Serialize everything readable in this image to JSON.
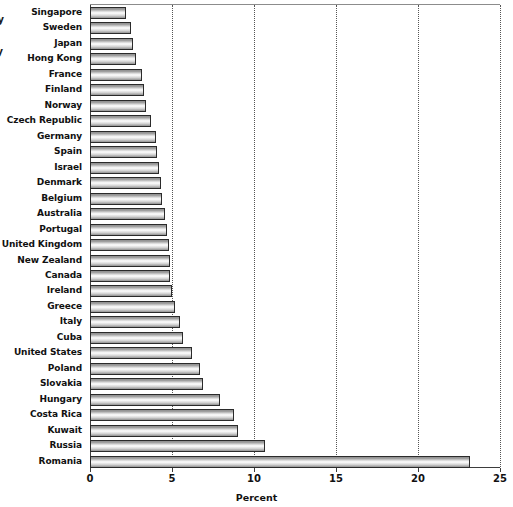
{
  "chart_data": {
    "type": "bar",
    "orientation": "horizontal",
    "title": "",
    "xlabel": "Percent",
    "ylabel": "",
    "xlim": [
      0,
      25
    ],
    "ylim": null,
    "grid": true,
    "gridlines_axis": "x",
    "legend": false,
    "legend_position": null,
    "xticks": [
      "0",
      "5",
      "10",
      "15",
      "20",
      "25"
    ],
    "xtick_values": [
      0,
      5,
      10,
      15,
      20,
      25
    ],
    "categories": [
      "Singapore",
      "Sweden",
      "Japan",
      "Hong Kong",
      "France",
      "Finland",
      "Norway",
      "Czech Republic",
      "Germany",
      "Spain",
      "Israel",
      "Denmark",
      "Belgium",
      "Australia",
      "Portugal",
      "United Kingdom",
      "New Zealand",
      "Canada",
      "Ireland",
      "Greece",
      "Italy",
      "Cuba",
      "United States",
      "Poland",
      "Slovakia",
      "Hungary",
      "Costa Rica",
      "Kuwait",
      "Russia",
      "Romania"
    ],
    "values": [
      2.2,
      2.5,
      2.6,
      2.8,
      3.2,
      3.3,
      3.4,
      3.7,
      4.0,
      4.1,
      4.2,
      4.3,
      4.4,
      4.6,
      4.7,
      4.8,
      4.9,
      4.9,
      5.0,
      5.2,
      5.5,
      5.7,
      6.2,
      6.7,
      6.9,
      7.9,
      8.8,
      9.0,
      10.7,
      23.2
    ]
  },
  "edge_fragments": {
    "fragment_1": "ly",
    "fragment_2": "ly"
  },
  "colors": {
    "bar_fill_light": "#fbfbfb",
    "bar_fill_dark": "#8f8f8f",
    "bar_outline": "#2b2b2b",
    "gridline": "#555555",
    "axis": "#3d3d3d",
    "text": "#111111",
    "background": "#ffffff"
  }
}
